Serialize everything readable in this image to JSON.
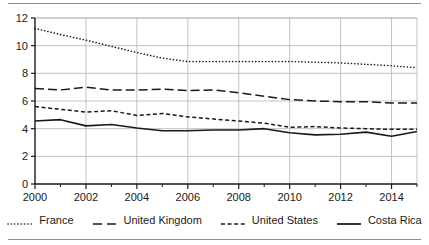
{
  "chart_data": {
    "type": "line",
    "title": "",
    "subtitle": "",
    "xlabel": "",
    "ylabel": "",
    "xlim": [
      2000,
      2015
    ],
    "ylim": [
      0,
      12
    ],
    "grid": true,
    "legend_position": "bottom",
    "x": [
      2000,
      2001,
      2002,
      2003,
      2004,
      2005,
      2006,
      2007,
      2008,
      2009,
      2010,
      2011,
      2012,
      2013,
      2014,
      2015
    ],
    "x_tick_labels": [
      "2000",
      "2002",
      "2004",
      "2006",
      "2008",
      "2010",
      "2012",
      "2014"
    ],
    "x_tick_values": [
      2000,
      2002,
      2004,
      2006,
      2008,
      2010,
      2012,
      2014
    ],
    "x_minor_tick_values": [
      2001,
      2003,
      2005,
      2007,
      2009,
      2011,
      2013,
      2015
    ],
    "y_tick_labels": [
      "0",
      "2",
      "4",
      "6",
      "8",
      "10",
      "12"
    ],
    "y_tick_values": [
      0,
      2,
      4,
      6,
      8,
      10,
      12
    ],
    "series": [
      {
        "name": "France",
        "style": "dotted",
        "color": "#1a1a1a",
        "values": [
          11.25,
          10.8,
          10.4,
          9.95,
          9.5,
          9.1,
          8.85,
          8.85,
          8.85,
          8.85,
          8.85,
          8.8,
          8.75,
          8.65,
          8.55,
          8.4
        ]
      },
      {
        "name": "United Kingdom",
        "style": "long-dash",
        "color": "#1a1a1a",
        "values": [
          6.9,
          6.8,
          7.0,
          6.8,
          6.8,
          6.85,
          6.75,
          6.8,
          6.6,
          6.35,
          6.1,
          6.0,
          5.95,
          5.95,
          5.85,
          5.85
        ]
      },
      {
        "name": "United States",
        "style": "short-dash",
        "color": "#1a1a1a",
        "values": [
          5.6,
          5.4,
          5.2,
          5.3,
          4.95,
          5.1,
          4.85,
          4.7,
          4.55,
          4.4,
          4.1,
          4.15,
          4.05,
          4.0,
          3.95,
          3.95
        ]
      },
      {
        "name": "Costa Rica",
        "style": "solid",
        "color": "#1a1a1a",
        "values": [
          4.55,
          4.65,
          4.2,
          4.3,
          4.05,
          3.85,
          3.85,
          3.9,
          3.9,
          4.0,
          3.7,
          3.55,
          3.6,
          3.75,
          3.45,
          3.8
        ]
      }
    ]
  },
  "legend": {
    "items": [
      {
        "label": "France",
        "marker": "dotted-line-icon"
      },
      {
        "label": "United Kingdom",
        "marker": "long-dash-line-icon"
      },
      {
        "label": "United States",
        "marker": "short-dash-line-icon"
      },
      {
        "label": "Costa Rica",
        "marker": "solid-line-icon"
      }
    ]
  }
}
